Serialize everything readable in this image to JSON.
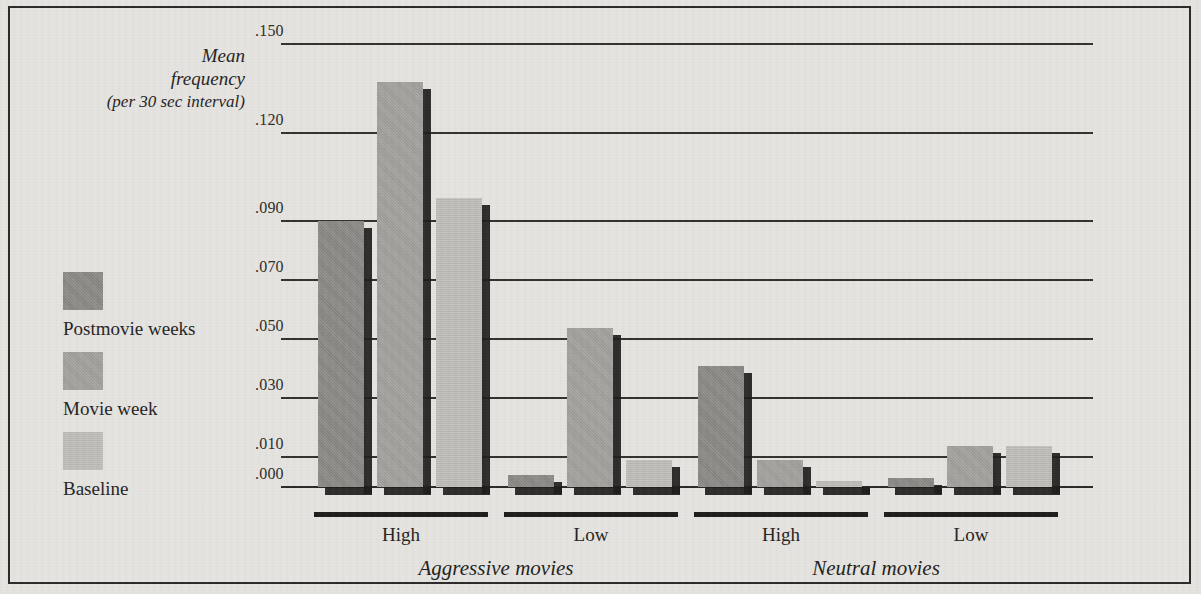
{
  "chart_data": {
    "type": "bar",
    "title": "",
    "ylabel": "Mean frequency (per 30 sec interval)",
    "ylabel_lines": [
      "Mean",
      "frequency",
      "(per 30 sec interval)"
    ],
    "xlabel": "",
    "ylim": [
      0.0,
      0.15
    ],
    "grid": true,
    "grid_axis": "y",
    "legend_position": "left",
    "ytick_labels": [
      ".150",
      ".120",
      ".090",
      ".070",
      ".050",
      ".030",
      ".010",
      ".000"
    ],
    "ytick_values": [
      0.15,
      0.12,
      0.09,
      0.07,
      0.05,
      0.03,
      0.01,
      0.0
    ],
    "panels": [
      "Aggressive movies",
      "Neutral movies"
    ],
    "categories": [
      "High",
      "Low",
      "High",
      "Low"
    ],
    "group_panel": [
      "Aggressive movies",
      "Aggressive movies",
      "Neutral movies",
      "Neutral movies"
    ],
    "series": [
      {
        "name": "Postmovie weeks",
        "color": "#8c8a86",
        "values": [
          0.09,
          0.004,
          0.041,
          0.003
        ]
      },
      {
        "name": "Movie week",
        "color": "#a3a19d",
        "values": [
          0.137,
          0.054,
          0.009,
          0.014
        ]
      },
      {
        "name": "Baseline",
        "color": "#bfbdb8",
        "values": [
          0.098,
          0.009,
          0.002,
          0.014
        ]
      }
    ],
    "series_draw_order_per_group": [
      "Postmovie weeks",
      "Movie week",
      "Baseline"
    ]
  },
  "axis": {
    "caption_line1": "Mean",
    "caption_line2": "frequency",
    "caption_line3": "(per 30 sec interval)",
    "tick_0": ".150",
    "tick_1": ".120",
    "tick_2": ".090",
    "tick_3": ".070",
    "tick_4": ".050",
    "tick_5": ".030",
    "tick_6": ".010",
    "tick_7": ".000"
  },
  "legend": {
    "items": [
      {
        "label": "Postmovie weeks",
        "swatch": "dark-gray-swatch",
        "color": "#8c8a86"
      },
      {
        "label": "Movie week",
        "swatch": "medium-gray-swatch",
        "color": "#a3a19d"
      },
      {
        "label": "Baseline",
        "swatch": "light-gray-swatch",
        "color": "#bfbdb8"
      }
    ]
  },
  "groups": [
    {
      "label": "High",
      "panel": "Aggressive movies"
    },
    {
      "label": "Low",
      "panel": "Aggressive movies"
    },
    {
      "label": "High",
      "panel": "Neutral movies"
    },
    {
      "label": "Low",
      "panel": "Neutral movies"
    }
  ],
  "panels": [
    {
      "label": "Aggressive movies"
    },
    {
      "label": "Neutral movies"
    }
  ]
}
